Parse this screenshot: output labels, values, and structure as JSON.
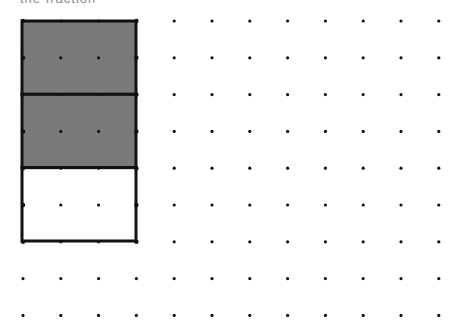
{
  "header": {
    "clipped_text": "the fraction"
  },
  "grid": {
    "cols": 12,
    "rows": 9,
    "x0": 23,
    "y0": 21,
    "dx": 37.8,
    "dy": 36.8,
    "dot_color": "#111111"
  },
  "shape": {
    "type": "rectangle",
    "x": 22,
    "y": 21,
    "width": 114,
    "height": 220,
    "parts": 3,
    "shaded_parts": 2,
    "shade_color": "#7a7a7a",
    "stroke_color": "#111111"
  }
}
